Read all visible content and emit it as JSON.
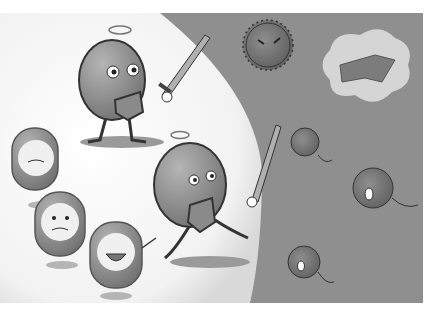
{
  "illustration": {
    "subject": "Cartoon of immune-system pill characters with swords and shields defending against germs",
    "palette": {
      "background": "#ffffff",
      "panel": "#8f8f8f",
      "sphere_light": "#f2f2f2",
      "character_fill": "#8a8a8a",
      "outline": "#333333"
    },
    "characters": [
      {
        "name": "hero-pill-top",
        "pose": "standing with sword and shield"
      },
      {
        "name": "hero-pill-bottom",
        "pose": "running with sword and shield"
      },
      {
        "name": "small-pill-1",
        "expression": "worried"
      },
      {
        "name": "small-pill-2",
        "expression": "worried"
      },
      {
        "name": "small-pill-3",
        "expression": "laughing"
      }
    ],
    "germs": [
      {
        "name": "germ-spiky-top",
        "expression": "angry"
      },
      {
        "name": "germ-cloud",
        "expression": "angry"
      },
      {
        "name": "germ-devil-1"
      },
      {
        "name": "germ-devil-2"
      },
      {
        "name": "germ-devil-3"
      }
    ]
  }
}
